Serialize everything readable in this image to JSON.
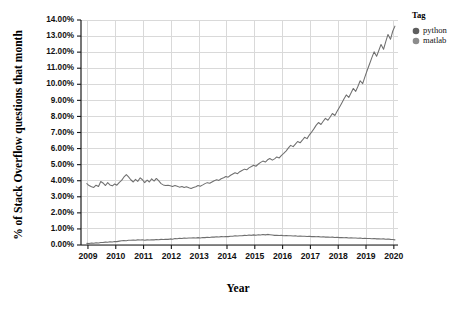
{
  "chart_data": {
    "type": "line",
    "title": "",
    "xlabel": "Year",
    "ylabel": "% of Stack Overflow questions that month",
    "xlim": [
      2008.75,
      2020.15
    ],
    "ylim": [
      0,
      14
    ],
    "grid": true,
    "legend_position": "right",
    "legend_title": "Tag",
    "y_tick_labels": [
      "0.00%",
      "1.00%",
      "2.00%",
      "3.00%",
      "4.00%",
      "5.00%",
      "6.00%",
      "7.00%",
      "8.00%",
      "9.00%",
      "10.00%",
      "11.00%",
      "12.00%",
      "13.00%",
      "14.00%"
    ],
    "y_tick_values": [
      0,
      1,
      2,
      3,
      4,
      5,
      6,
      7,
      8,
      9,
      10,
      11,
      12,
      13,
      14
    ],
    "x_tick_labels": [
      "2009",
      "2010",
      "2011",
      "2012",
      "2013",
      "2014",
      "2015",
      "2016",
      "2017",
      "2018",
      "2019",
      "2020"
    ],
    "x_tick_values": [
      2009,
      2010,
      2011,
      2012,
      2013,
      2014,
      2015,
      2016,
      2017,
      2018,
      2019,
      2020
    ],
    "series": [
      {
        "name": "python",
        "color": "#6f6f6f",
        "x": [
          2008.96,
          2009.04,
          2009.13,
          2009.21,
          2009.29,
          2009.38,
          2009.46,
          2009.54,
          2009.63,
          2009.71,
          2009.79,
          2009.88,
          2009.96,
          2010.04,
          2010.13,
          2010.21,
          2010.29,
          2010.38,
          2010.46,
          2010.54,
          2010.63,
          2010.71,
          2010.79,
          2010.88,
          2010.96,
          2011.04,
          2011.13,
          2011.21,
          2011.29,
          2011.38,
          2011.46,
          2011.54,
          2011.63,
          2011.71,
          2011.79,
          2011.88,
          2011.96,
          2012.04,
          2012.13,
          2012.21,
          2012.29,
          2012.38,
          2012.46,
          2012.54,
          2012.63,
          2012.71,
          2012.79,
          2012.88,
          2012.96,
          2013.04,
          2013.13,
          2013.21,
          2013.29,
          2013.38,
          2013.46,
          2013.54,
          2013.63,
          2013.71,
          2013.79,
          2013.88,
          2013.96,
          2014.04,
          2014.13,
          2014.21,
          2014.29,
          2014.38,
          2014.46,
          2014.54,
          2014.63,
          2014.71,
          2014.79,
          2014.88,
          2014.96,
          2015.04,
          2015.13,
          2015.21,
          2015.29,
          2015.38,
          2015.46,
          2015.54,
          2015.63,
          2015.71,
          2015.79,
          2015.88,
          2015.96,
          2016.04,
          2016.13,
          2016.21,
          2016.29,
          2016.38,
          2016.46,
          2016.54,
          2016.63,
          2016.71,
          2016.79,
          2016.88,
          2016.96,
          2017.04,
          2017.13,
          2017.21,
          2017.29,
          2017.38,
          2017.46,
          2017.54,
          2017.63,
          2017.71,
          2017.79,
          2017.88,
          2017.96,
          2018.04,
          2018.13,
          2018.21,
          2018.29,
          2018.38,
          2018.46,
          2018.54,
          2018.63,
          2018.71,
          2018.79,
          2018.88,
          2018.96,
          2019.04,
          2019.13,
          2019.21,
          2019.29,
          2019.38,
          2019.46,
          2019.54,
          2019.63,
          2019.71,
          2019.79,
          2019.88,
          2019.96,
          2020.04
        ],
        "values": [
          3.82,
          3.7,
          3.62,
          3.58,
          3.72,
          3.64,
          3.95,
          3.86,
          3.7,
          3.88,
          3.74,
          3.68,
          3.8,
          3.72,
          3.9,
          4.02,
          4.22,
          4.38,
          4.24,
          4.06,
          3.92,
          4.08,
          3.96,
          4.18,
          4.06,
          3.88,
          4.04,
          3.92,
          4.12,
          3.98,
          4.14,
          4.0,
          3.82,
          3.74,
          3.7,
          3.72,
          3.68,
          3.64,
          3.7,
          3.66,
          3.6,
          3.64,
          3.58,
          3.62,
          3.56,
          3.52,
          3.58,
          3.62,
          3.7,
          3.66,
          3.74,
          3.82,
          3.88,
          3.84,
          3.92,
          4.0,
          4.06,
          4.02,
          4.12,
          4.18,
          4.26,
          4.22,
          4.34,
          4.42,
          4.5,
          4.44,
          4.56,
          4.64,
          4.72,
          4.68,
          4.8,
          4.88,
          4.96,
          4.9,
          5.04,
          5.14,
          5.22,
          5.16,
          5.3,
          5.38,
          5.28,
          5.36,
          5.48,
          5.42,
          5.58,
          5.7,
          5.86,
          6.04,
          6.2,
          6.12,
          6.28,
          6.44,
          6.36,
          6.52,
          6.7,
          6.62,
          6.84,
          7.02,
          7.24,
          7.46,
          7.62,
          7.5,
          7.7,
          7.88,
          7.76,
          7.96,
          8.18,
          8.06,
          8.32,
          8.56,
          8.84,
          9.1,
          9.34,
          9.18,
          9.46,
          9.74,
          9.56,
          9.88,
          10.22,
          10.04,
          10.46,
          10.86,
          11.28,
          11.66,
          12.02,
          11.74,
          12.1,
          12.48,
          12.18,
          12.66,
          13.1,
          12.8,
          13.3,
          13.62
        ]
      },
      {
        "name": "matlab",
        "color": "#8a8a8a",
        "x": [
          2008.96,
          2009.04,
          2009.13,
          2009.21,
          2009.29,
          2009.38,
          2009.46,
          2009.54,
          2009.63,
          2009.71,
          2009.79,
          2009.88,
          2009.96,
          2010.04,
          2010.13,
          2010.21,
          2010.29,
          2010.38,
          2010.46,
          2010.54,
          2010.63,
          2010.71,
          2010.79,
          2010.88,
          2010.96,
          2011.04,
          2011.13,
          2011.21,
          2011.29,
          2011.38,
          2011.46,
          2011.54,
          2011.63,
          2011.71,
          2011.79,
          2011.88,
          2011.96,
          2012.04,
          2012.13,
          2012.21,
          2012.29,
          2012.38,
          2012.46,
          2012.54,
          2012.63,
          2012.71,
          2012.79,
          2012.88,
          2012.96,
          2013.04,
          2013.13,
          2013.21,
          2013.29,
          2013.38,
          2013.46,
          2013.54,
          2013.63,
          2013.71,
          2013.79,
          2013.88,
          2013.96,
          2014.04,
          2014.13,
          2014.21,
          2014.29,
          2014.38,
          2014.46,
          2014.54,
          2014.63,
          2014.71,
          2014.79,
          2014.88,
          2014.96,
          2015.04,
          2015.13,
          2015.21,
          2015.29,
          2015.38,
          2015.46,
          2015.54,
          2015.63,
          2015.71,
          2015.79,
          2015.88,
          2015.96,
          2016.04,
          2016.13,
          2016.21,
          2016.29,
          2016.38,
          2016.46,
          2016.54,
          2016.63,
          2016.71,
          2016.79,
          2016.88,
          2016.96,
          2017.04,
          2017.13,
          2017.21,
          2017.29,
          2017.38,
          2017.46,
          2017.54,
          2017.63,
          2017.71,
          2017.79,
          2017.88,
          2017.96,
          2018.04,
          2018.13,
          2018.21,
          2018.29,
          2018.38,
          2018.46,
          2018.54,
          2018.63,
          2018.71,
          2018.79,
          2018.88,
          2018.96,
          2019.04,
          2019.13,
          2019.21,
          2019.29,
          2019.38,
          2019.46,
          2019.54,
          2019.63,
          2019.71,
          2019.79,
          2019.88,
          2019.96,
          2020.04
        ],
        "values": [
          0.1,
          0.09,
          0.12,
          0.11,
          0.14,
          0.13,
          0.16,
          0.15,
          0.18,
          0.17,
          0.2,
          0.19,
          0.22,
          0.21,
          0.24,
          0.26,
          0.28,
          0.27,
          0.3,
          0.29,
          0.31,
          0.3,
          0.32,
          0.31,
          0.33,
          0.3,
          0.32,
          0.31,
          0.33,
          0.32,
          0.34,
          0.33,
          0.35,
          0.34,
          0.36,
          0.35,
          0.38,
          0.36,
          0.4,
          0.39,
          0.42,
          0.4,
          0.43,
          0.42,
          0.44,
          0.43,
          0.45,
          0.44,
          0.46,
          0.44,
          0.47,
          0.46,
          0.48,
          0.47,
          0.5,
          0.49,
          0.51,
          0.5,
          0.52,
          0.51,
          0.53,
          0.52,
          0.55,
          0.54,
          0.57,
          0.56,
          0.58,
          0.57,
          0.6,
          0.59,
          0.62,
          0.6,
          0.63,
          0.6,
          0.64,
          0.62,
          0.65,
          0.63,
          0.66,
          0.64,
          0.62,
          0.6,
          0.61,
          0.59,
          0.6,
          0.58,
          0.59,
          0.57,
          0.58,
          0.56,
          0.57,
          0.55,
          0.56,
          0.54,
          0.55,
          0.53,
          0.54,
          0.52,
          0.53,
          0.51,
          0.52,
          0.5,
          0.51,
          0.49,
          0.5,
          0.48,
          0.49,
          0.47,
          0.48,
          0.46,
          0.47,
          0.45,
          0.46,
          0.44,
          0.45,
          0.43,
          0.44,
          0.42,
          0.43,
          0.41,
          0.42,
          0.4,
          0.41,
          0.39,
          0.4,
          0.38,
          0.39,
          0.37,
          0.38,
          0.36,
          0.37,
          0.35,
          0.34,
          0.32
        ]
      }
    ]
  },
  "legend": {
    "title": "Tag",
    "items": [
      {
        "label": "python",
        "color": "#5e5e5e"
      },
      {
        "label": "matlab",
        "color": "#8c8c8c"
      }
    ]
  },
  "axes": {
    "x_title": "Year",
    "y_title": "% of Stack Overflow questions that month"
  }
}
